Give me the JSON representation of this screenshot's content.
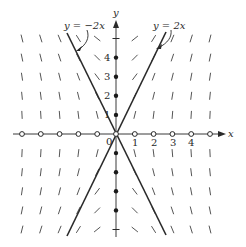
{
  "figure": {
    "origin_label": "0",
    "x_axis_label": "x",
    "y_axis_label": "y",
    "x_tick_labels": [
      "1",
      "2",
      "3",
      "4"
    ],
    "y_tick_labels": [
      "1",
      "2",
      "3",
      "4"
    ],
    "lines": [
      {
        "label": "y = −2x",
        "slope": -2
      },
      {
        "label": "y = 2x",
        "slope": 2
      }
    ],
    "grid": {
      "x_range": [
        -5,
        5
      ],
      "y_range": [
        -5,
        5
      ],
      "step": 1
    },
    "markers": {
      "x_axis": "open-circle",
      "y_axis": "filled-dot"
    },
    "colors": {
      "ink": "#2a2a2a",
      "segment": "#555555",
      "background": "#ffffff"
    }
  }
}
